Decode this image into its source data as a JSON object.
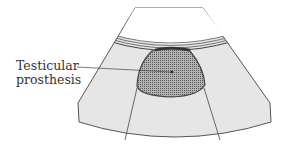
{
  "diagram": {
    "type": "ultrasound-schematic",
    "labels": [
      {
        "id": "testicular-prosthesis",
        "line1": "Testicular",
        "line2": "prosthesis"
      }
    ],
    "colors": {
      "tissue": "#e6e6e6",
      "prosthesis": "#8f8f8f",
      "outline": "#444444",
      "background": "#ffffff"
    }
  }
}
